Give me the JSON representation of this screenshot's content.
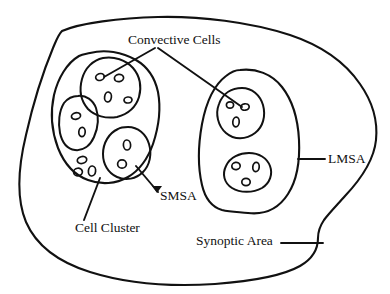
{
  "figure": {
    "title_present": false,
    "style": "hand-drawn line diagram",
    "background_color": "#ffffff",
    "stroke_color": "#111111"
  },
  "labels": {
    "convective_cells": "Convective Cells",
    "lmsa": "LMSA",
    "smsa": "SMSA",
    "cell_cluster": "Cell Cluster",
    "synoptic_area": "Synoptic Area"
  },
  "diagram_data": {
    "type": "nested-region-diagram",
    "description": "Hand-drawn schematic of nested meteorological scales: a large Synoptic Area enclosing two mesoscale areas, each containing convective cells which in turn contain small nuclei.",
    "regions": [
      {
        "name": "Synoptic Area",
        "label": "Synoptic Area",
        "level": 1,
        "shape": "large irregular closed blob spanning the whole figure",
        "contains": [
          "Cell Cluster (SMSA)",
          "LMSA"
        ],
        "leader": "horizontal line from label right to the lower-right boundary"
      },
      {
        "name": "Cell Cluster (SMSA)",
        "label": "Cell Cluster",
        "secondary_label": "SMSA",
        "level": 2,
        "shape": "rounded irregular blob, left of centre",
        "convective_cell_count": 3,
        "free_nuclei_count": 3,
        "leader": "diagonal line from 'Cell Cluster' label up to the cluster boundary"
      },
      {
        "name": "LMSA",
        "label": "LMSA",
        "level": 2,
        "shape": "tall rounded irregular blob, right of centre",
        "convective_cell_count": 2,
        "free_nuclei_count": 0,
        "leader": "horizontal line from label left to the LMSA boundary"
      }
    ],
    "convective_cells": [
      {
        "parent": "Cell Cluster (SMSA)",
        "position": "upper",
        "nuclei_count": 4,
        "labelled_by": "Convective Cells"
      },
      {
        "parent": "Cell Cluster (SMSA)",
        "position": "left",
        "nuclei_count": 2,
        "labelled_by": null
      },
      {
        "parent": "Cell Cluster (SMSA)",
        "position": "lower-right",
        "nuclei_count": 2,
        "labelled_by": "SMSA"
      },
      {
        "parent": "LMSA",
        "position": "upper",
        "nuclei_count": 3,
        "labelled_by": "Convective Cells"
      },
      {
        "parent": "LMSA",
        "position": "lower",
        "nuclei_count": 3,
        "labelled_by": null
      }
    ],
    "leader_lines": [
      {
        "from": "Convective Cells",
        "to": "upper convective cell of Cell Cluster",
        "style": "plain line"
      },
      {
        "from": "Convective Cells",
        "to": "upper convective cell of LMSA",
        "style": "plain line"
      },
      {
        "from": "SMSA",
        "to": "Cell Cluster boundary",
        "style": "arrow"
      },
      {
        "from": "Cell Cluster",
        "to": "Cell Cluster boundary",
        "style": "plain line"
      },
      {
        "from": "LMSA",
        "to": "LMSA boundary",
        "style": "plain line"
      },
      {
        "from": "Synoptic Area",
        "to": "Synoptic Area boundary",
        "style": "plain line"
      }
    ],
    "counts": {
      "mesoscale_areas": 2,
      "convective_cells_total": 5,
      "free_nuclei_total": 3
    }
  }
}
